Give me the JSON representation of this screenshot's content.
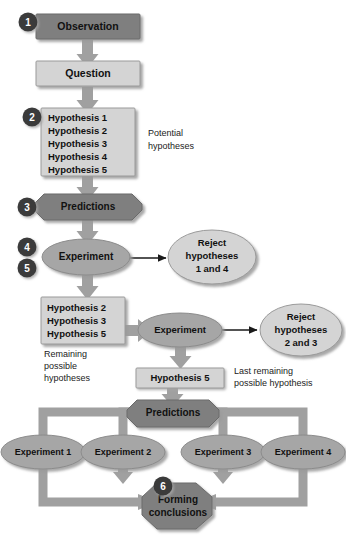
{
  "diagram": {
    "colors": {
      "dark_fill": "#7f7f7f",
      "mid_fill": "#a6a6a6",
      "light_fill": "#d4d4d4",
      "connector": "#a0a0a0",
      "badge": "#3a3a3a",
      "outline": "#6b6b6b",
      "shadow": "#bfbfbf",
      "text": "#111111"
    },
    "steps": [
      {
        "badge": "1",
        "name": "observation",
        "label": "Observation",
        "shape": "rect",
        "tone": "dark"
      },
      {
        "badge": "",
        "name": "question",
        "label": "Question",
        "shape": "rect",
        "tone": "light"
      },
      {
        "badge": "2",
        "name": "potential-hypotheses",
        "label": "Hypothesis 1\nHypothesis 2\nHypothesis 3\nHypothesis 4\nHypothesis 5",
        "shape": "rect",
        "tone": "light",
        "note": "Potential hypotheses"
      },
      {
        "badge": "3",
        "name": "predictions-top",
        "label": "Predictions",
        "shape": "octagon",
        "tone": "dark"
      },
      {
        "badge": "4,5",
        "name": "experiment-first",
        "label": "Experiment",
        "shape": "ellipse",
        "tone": "mid"
      },
      {
        "badge": "",
        "name": "reject-1-4",
        "label": "Reject\nhypotheses\n1 and 4",
        "shape": "ellipse",
        "tone": "light"
      },
      {
        "badge": "",
        "name": "remaining-hypotheses",
        "label": "Hypothesis 2\nHypothesis 3\nHypothesis 5",
        "shape": "rect",
        "tone": "light",
        "note": "Remaining possible hypotheses"
      },
      {
        "badge": "",
        "name": "experiment-second",
        "label": "Experiment",
        "shape": "ellipse",
        "tone": "mid"
      },
      {
        "badge": "",
        "name": "reject-2-3",
        "label": "Reject\nhypotheses\n2 and 3",
        "shape": "ellipse",
        "tone": "light"
      },
      {
        "badge": "",
        "name": "hypothesis-5",
        "label": "Hypothesis 5",
        "shape": "rect",
        "tone": "light",
        "note": "Last remaining possible hypothesis"
      },
      {
        "badge": "",
        "name": "predictions-bottom",
        "label": "Predictions",
        "shape": "octagon",
        "tone": "dark"
      },
      {
        "badge": "6",
        "name": "forming-conclusions",
        "label": "Forming\nconclusions",
        "shape": "octagon",
        "tone": "dark"
      }
    ],
    "nodes": {
      "observation": "Observation",
      "question": "Question",
      "hypothesis_1": "Hypothesis 1",
      "hypothesis_2": "Hypothesis 2",
      "hypothesis_3": "Hypothesis 3",
      "hypothesis_4": "Hypothesis 4",
      "hypothesis_5": "Hypothesis 5",
      "predictions_top": "Predictions",
      "experiment_first": "Experiment",
      "reject_1_line1": "Reject",
      "reject_1_line2": "hypotheses",
      "reject_1_line3": "1 and 4",
      "remaining_h2": "Hypothesis 2",
      "remaining_h3": "Hypothesis 3",
      "remaining_h5": "Hypothesis 5",
      "experiment_second": "Experiment",
      "reject_2_line1": "Reject",
      "reject_2_line2": "hypotheses",
      "reject_2_line3": "2 and 3",
      "hypothesis_5_box": "Hypothesis 5",
      "predictions_bottom": "Predictions",
      "experiment_1": "Experiment 1",
      "experiment_2": "Experiment 2",
      "experiment_3": "Experiment 3",
      "experiment_4": "Experiment 4",
      "forming_line1": "Forming",
      "forming_line2": "conclusions"
    },
    "notes": {
      "potential_line1": "Potential",
      "potential_line2": "hypotheses",
      "remaining_line1": "Remaining",
      "remaining_line2": "possible",
      "remaining_line3": "hypotheses",
      "last_line1": "Last remaining",
      "last_line2": "possible hypothesis"
    },
    "badges": {
      "one": "1",
      "two": "2",
      "three": "3",
      "four": "4",
      "five": "5",
      "six": "6"
    }
  }
}
